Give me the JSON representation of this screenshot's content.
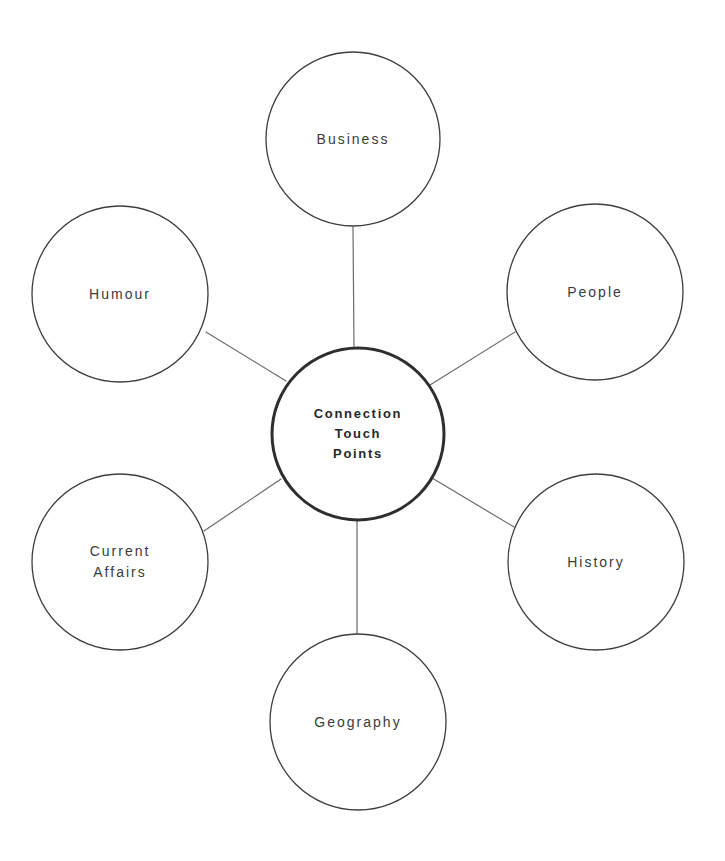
{
  "diagram": {
    "type": "hub-and-spoke",
    "title": "Connection Touch Points",
    "background_color": "#ffffff",
    "center": {
      "id": "connection-touch-points",
      "label": "Connection\nTouch\nPoints",
      "label_lines": [
        "Connection",
        "Touch",
        "Points"
      ],
      "cx": 358,
      "cy": 434,
      "r": 86,
      "stroke": "#2e2e2e",
      "stroke_width": 3,
      "fill": "#ffffff",
      "text_color": "#26282b",
      "font_weight": "bold"
    },
    "nodes": [
      {
        "id": "business",
        "label": "Business",
        "position": "top",
        "cx": 353,
        "cy": 139,
        "r": 87,
        "stroke": "#3d3d3d",
        "stroke_width": 1.3,
        "fill": "#ffffff",
        "text_color": "#3b3b3b"
      },
      {
        "id": "people",
        "label": "People",
        "position": "upper-right",
        "cx": 595,
        "cy": 292,
        "r": 88,
        "stroke": "#3d3d3d",
        "stroke_width": 1.3,
        "fill": "#ffffff",
        "text_color": "#3b3b3b"
      },
      {
        "id": "history",
        "label": "History",
        "position": "lower-right",
        "cx": 596,
        "cy": 562,
        "r": 88,
        "stroke": "#3d3d3d",
        "stroke_width": 1.3,
        "fill": "#ffffff",
        "text_color": "#3b3b3b"
      },
      {
        "id": "geography",
        "label": "Geography",
        "position": "bottom",
        "cx": 358,
        "cy": 722,
        "r": 88,
        "stroke": "#3d3d3d",
        "stroke_width": 1.3,
        "fill": "#ffffff",
        "text_color": "#3b3b3b"
      },
      {
        "id": "current-affairs",
        "label": "Current\nAffairs",
        "label_lines": [
          "Current",
          "Affairs"
        ],
        "position": "lower-left",
        "cx": 120,
        "cy": 562,
        "r": 88,
        "stroke": "#3d3d3d",
        "stroke_width": 1.3,
        "fill": "#ffffff",
        "text_color": "#3b3b3b"
      },
      {
        "id": "humour",
        "label": "Humour",
        "position": "upper-left",
        "cx": 120,
        "cy": 294,
        "r": 88,
        "stroke": "#3d3d3d",
        "stroke_width": 1.3,
        "fill": "#ffffff",
        "text_color": "#3b3b3b"
      }
    ],
    "connectors": [
      {
        "id": "connector-business",
        "from": "center",
        "to": "business",
        "x1": 354,
        "y1": 347,
        "x2": 353,
        "y2": 227,
        "stroke": "#6b6b6b",
        "stroke_width": 1.2
      },
      {
        "id": "connector-people",
        "from": "center",
        "to": "people",
        "x1": 430,
        "y1": 385,
        "x2": 515,
        "y2": 332,
        "stroke": "#6b6b6b",
        "stroke_width": 1.2
      },
      {
        "id": "connector-history",
        "from": "center",
        "to": "history",
        "x1": 432,
        "y1": 478,
        "x2": 514,
        "y2": 527,
        "stroke": "#6b6b6b",
        "stroke_width": 1.2
      },
      {
        "id": "connector-geography",
        "from": "center",
        "to": "geography",
        "x1": 357,
        "y1": 521,
        "x2": 357,
        "y2": 636,
        "stroke": "#6b6b6b",
        "stroke_width": 1.2
      },
      {
        "id": "connector-current-affairs",
        "from": "center",
        "to": "current-affairs",
        "x1": 281,
        "y1": 479,
        "x2": 204,
        "y2": 531,
        "stroke": "#6b6b6b",
        "stroke_width": 1.2
      },
      {
        "id": "connector-humour",
        "from": "center",
        "to": "humour",
        "x1": 286,
        "y1": 381,
        "x2": 206,
        "y2": 332,
        "stroke": "#6b6b6b",
        "stroke_width": 1.2
      }
    ]
  }
}
